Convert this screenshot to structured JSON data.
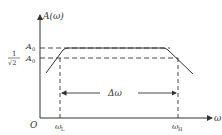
{
  "diagram": {
    "type": "amplitude-frequency-response",
    "y_axis_label": "A(ω)",
    "x_axis_label": "ω",
    "origin_label": "O",
    "levels": [
      {
        "label_main": "A",
        "label_sub": "0",
        "prefix": ""
      },
      {
        "label_main": "A",
        "label_sub": "0",
        "prefix_num": "1",
        "prefix_den": "√2"
      }
    ],
    "frequencies": [
      {
        "label_main": "ω",
        "label_sub": "L"
      },
      {
        "label_main": "ω",
        "label_sub": "H"
      }
    ],
    "bandwidth_label": "Δω",
    "colors": {
      "stroke": "#333333",
      "background": "#ffffff"
    }
  }
}
